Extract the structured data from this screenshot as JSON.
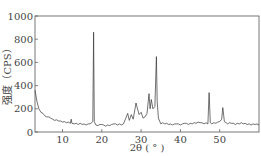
{
  "chart_data": {
    "type": "line",
    "title": "",
    "xlabel": "2θ (°)",
    "ylabel": "强度 (CPS)",
    "xlim": [
      3,
      60
    ],
    "ylim": [
      0,
      1000
    ],
    "xticks": [
      10,
      20,
      30,
      40,
      50
    ],
    "yticks": [
      0,
      200,
      400,
      600,
      800,
      1000
    ],
    "grid": false,
    "legend": null,
    "series": [
      {
        "name": "XRD",
        "x": [
          3,
          3.5,
          4,
          5,
          6,
          7,
          8,
          9,
          10,
          11,
          12,
          12.2,
          12.4,
          13,
          14,
          15,
          16,
          17,
          17.7,
          17.9,
          18.1,
          18.5,
          19,
          20,
          21,
          22,
          23,
          24,
          25,
          26,
          26.6,
          27,
          27.5,
          28,
          28.7,
          29,
          29.5,
          30,
          30.5,
          31,
          31.5,
          32,
          32.3,
          32.6,
          33,
          33.5,
          33.9,
          34.1,
          34.4,
          35,
          36,
          37,
          38,
          39,
          40,
          41,
          42,
          43,
          44,
          45,
          46,
          47,
          47.3,
          47.6,
          48,
          49,
          50,
          50.5,
          50.8,
          51.2,
          52,
          53,
          54,
          55,
          56,
          57,
          58,
          59,
          60
        ],
        "values": [
          360,
          260,
          200,
          160,
          130,
          120,
          100,
          95,
          85,
          80,
          75,
          110,
          75,
          70,
          65,
          65,
          60,
          70,
          90,
          860,
          90,
          60,
          55,
          65,
          50,
          55,
          70,
          60,
          60,
          110,
          160,
          100,
          150,
          110,
          250,
          210,
          150,
          170,
          120,
          130,
          160,
          330,
          200,
          280,
          200,
          220,
          650,
          260,
          120,
          70,
          70,
          65,
          60,
          70,
          60,
          75,
          65,
          70,
          75,
          80,
          70,
          70,
          340,
          80,
          70,
          75,
          90,
          110,
          210,
          90,
          70,
          75,
          65,
          70,
          70,
          65,
          60,
          65,
          60
        ]
      }
    ]
  },
  "axes": {
    "x_label": "2θ ( ° )",
    "y_label": "强度（CPS）"
  }
}
